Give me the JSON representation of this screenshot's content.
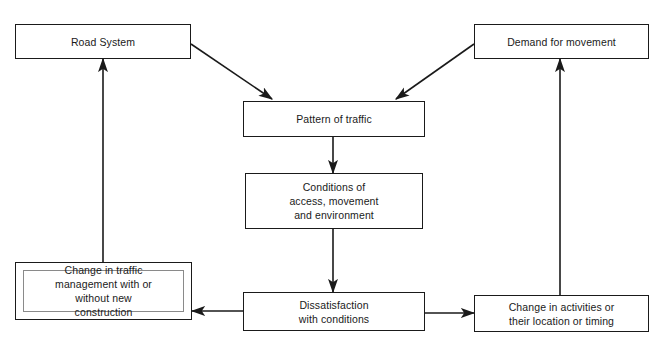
{
  "diagram": {
    "canvas": {
      "width": 664,
      "height": 345,
      "background": "#ffffff"
    },
    "stroke_color": "#1a1a1a",
    "nodes": [
      {
        "id": "road-system",
        "label": "Road System",
        "shaded": false
      },
      {
        "id": "demand-for-movement",
        "label": "Demand for movement",
        "shaded": false
      },
      {
        "id": "pattern-of-traffic",
        "label": "Pattern of traffic",
        "shaded": false
      },
      {
        "id": "conditions",
        "label": "Conditions of\naccess, movement\nand environment",
        "shaded": false
      },
      {
        "id": "change-in-traffic-management",
        "label": "Change in traffic\nmanagement with or\nwithout new\nconstruction",
        "shaded": true
      },
      {
        "id": "dissatisfaction",
        "label": "Dissatisfaction\nwith conditions",
        "shaded": false
      },
      {
        "id": "change-in-activities",
        "label": "Change in activities or\ntheir location or timing",
        "shaded": false
      }
    ],
    "edges": [
      {
        "id": "road-system-to-pattern",
        "from": "road-system",
        "to": "pattern-of-traffic",
        "direction": "to"
      },
      {
        "id": "demand-to-pattern",
        "from": "demand-for-movement",
        "to": "pattern-of-traffic",
        "direction": "to"
      },
      {
        "id": "pattern-to-conditions",
        "from": "pattern-of-traffic",
        "to": "conditions",
        "direction": "to"
      },
      {
        "id": "conditions-to-dissatisfaction",
        "from": "conditions",
        "to": "dissatisfaction",
        "direction": "to"
      },
      {
        "id": "dissatisfaction-to-change-management",
        "from": "dissatisfaction",
        "to": "change-in-traffic-management",
        "direction": "to"
      },
      {
        "id": "dissatisfaction-to-change-activities",
        "from": "dissatisfaction",
        "to": "change-in-activities",
        "direction": "to"
      },
      {
        "id": "change-management-to-road-system",
        "from": "change-in-traffic-management",
        "to": "road-system",
        "direction": "to"
      },
      {
        "id": "change-activities-to-demand",
        "from": "change-in-activities",
        "to": "demand-for-movement",
        "direction": "to"
      }
    ]
  }
}
